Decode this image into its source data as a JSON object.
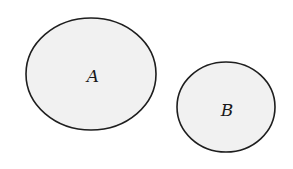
{
  "diagram": {
    "type": "disjoint-sets",
    "sets": [
      {
        "label": "A",
        "cx": 91,
        "cy": 74,
        "rx": 65,
        "ry": 56,
        "label_x": 93,
        "label_y": 82
      },
      {
        "label": "B",
        "cx": 226,
        "cy": 107,
        "rx": 49,
        "ry": 45,
        "label_x": 227,
        "label_y": 116
      }
    ],
    "colors": {
      "fill": "#f1f1f1",
      "stroke": "#1e1e1e",
      "label": "#1a1a1a"
    }
  }
}
